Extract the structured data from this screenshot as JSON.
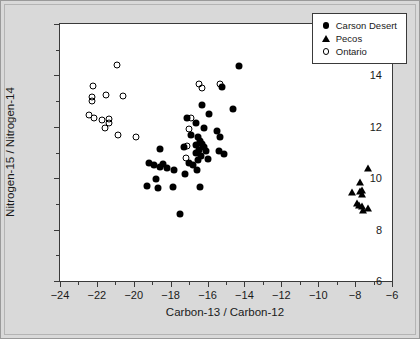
{
  "chart_data": {
    "type": "scatter",
    "title": "",
    "xlabel": "Carbon-13 / Carbon-12",
    "ylabel": "Nitrogen-15 / Nitrogen-14",
    "xlim": [
      -24,
      -6
    ],
    "ylim": [
      6,
      16
    ],
    "xticks": [
      -24,
      -22,
      -20,
      -18,
      -16,
      -14,
      -12,
      -10,
      -8,
      -6
    ],
    "xticks_minor": [
      -23,
      -21,
      -19,
      -17,
      -15,
      -13,
      -11,
      -9,
      -7
    ],
    "yticks": [
      6,
      8,
      10,
      12,
      14,
      16
    ],
    "yticks_minor": [
      7,
      9,
      11,
      13,
      15
    ],
    "grid": false,
    "legend_position": "top-right",
    "series": [
      {
        "name": "Carson Desert",
        "marker": "filled-circle",
        "color": "#000000",
        "points": [
          [
            -14.3,
            14.35
          ],
          [
            -15.2,
            13.55
          ],
          [
            -16.3,
            12.85
          ],
          [
            -14.6,
            12.7
          ],
          [
            -17.1,
            12.35
          ],
          [
            -15.9,
            12.5
          ],
          [
            -16.6,
            12.15
          ],
          [
            -16.2,
            11.95
          ],
          [
            -15.5,
            11.85
          ],
          [
            -16.5,
            11.6
          ],
          [
            -16.4,
            11.45
          ],
          [
            -16.3,
            11.35
          ],
          [
            -16.6,
            11.3
          ],
          [
            -16.2,
            11.2
          ],
          [
            -16.45,
            11.1
          ],
          [
            -16.1,
            11.05
          ],
          [
            -16.6,
            11.0
          ],
          [
            -15.4,
            11.05
          ],
          [
            -16.35,
            10.85
          ],
          [
            -16.0,
            10.75
          ],
          [
            -16.5,
            10.7
          ],
          [
            -17.3,
            11.2
          ],
          [
            -18.6,
            11.15
          ],
          [
            -17.0,
            10.6
          ],
          [
            -16.8,
            10.5
          ],
          [
            -19.2,
            10.6
          ],
          [
            -18.9,
            10.5
          ],
          [
            -18.6,
            10.45
          ],
          [
            -18.4,
            10.55
          ],
          [
            -18.2,
            10.4
          ],
          [
            -17.8,
            10.3
          ],
          [
            -16.55,
            10.3
          ],
          [
            -18.8,
            9.95
          ],
          [
            -19.3,
            9.7
          ],
          [
            -18.7,
            9.6
          ],
          [
            -17.9,
            9.65
          ],
          [
            -16.4,
            9.65
          ],
          [
            -17.5,
            8.6
          ],
          [
            -15.3,
            11.6
          ],
          [
            -15.1,
            10.95
          ],
          [
            -16.9,
            11.7
          ],
          [
            -17.2,
            10.15
          ]
        ]
      },
      {
        "name": "Pecos",
        "marker": "filled-triangle",
        "color": "#000000",
        "points": [
          [
            -7.3,
            10.4
          ],
          [
            -7.75,
            9.85
          ],
          [
            -8.15,
            9.45
          ],
          [
            -7.75,
            9.5
          ],
          [
            -7.65,
            9.4
          ],
          [
            -7.6,
            9.55
          ],
          [
            -7.9,
            9.05
          ],
          [
            -7.8,
            8.95
          ],
          [
            -7.6,
            8.9
          ],
          [
            -7.3,
            8.85
          ],
          [
            -7.55,
            8.75
          ]
        ]
      },
      {
        "name": "Ontario",
        "marker": "open-circle",
        "color": "#000000",
        "points": [
          [
            -20.9,
            14.4
          ],
          [
            -22.2,
            13.6
          ],
          [
            -22.25,
            13.15
          ],
          [
            -22.25,
            13.0
          ],
          [
            -21.5,
            13.25
          ],
          [
            -20.6,
            13.2
          ],
          [
            -16.45,
            13.65
          ],
          [
            -16.3,
            13.5
          ],
          [
            -15.3,
            13.65
          ],
          [
            -22.45,
            12.45
          ],
          [
            -22.15,
            12.35
          ],
          [
            -21.7,
            12.25
          ],
          [
            -21.35,
            12.3
          ],
          [
            -21.35,
            12.15
          ],
          [
            -21.55,
            11.95
          ],
          [
            -20.85,
            11.7
          ],
          [
            -19.9,
            11.6
          ],
          [
            -16.9,
            12.35
          ],
          [
            -17.0,
            11.9
          ],
          [
            -17.1,
            11.25
          ],
          [
            -17.15,
            10.8
          ]
        ]
      }
    ]
  },
  "legend": {
    "items": [
      {
        "label": "Carson Desert",
        "marker": "filled-circle"
      },
      {
        "label": "Pecos",
        "marker": "filled-triangle"
      },
      {
        "label": "Ontario",
        "marker": "open-circle"
      }
    ]
  }
}
